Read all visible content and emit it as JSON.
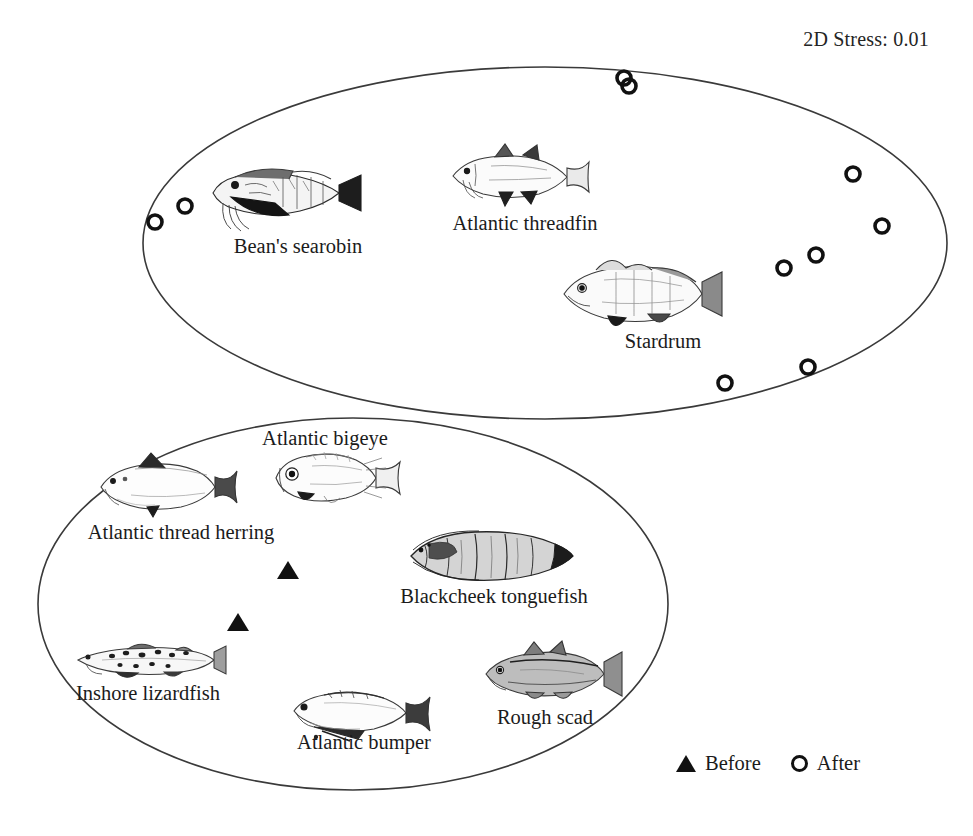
{
  "annotation": {
    "stress_label": "2D Stress: 0.01"
  },
  "legend": {
    "before_label": "Before",
    "after_label": "After",
    "before_marker": "filled-triangle",
    "after_marker": "open-circle"
  },
  "colors": {
    "ink": "#1a1a1a",
    "marker": "#111111",
    "ellipse_stroke": "#3a3a3a",
    "background": "#ffffff"
  },
  "groups": [
    {
      "id": "after-group",
      "name": "After assemblage",
      "marker": "open-circle",
      "ellipse": {
        "cx": 545,
        "cy": 243,
        "rx": 402,
        "ry": 176
      },
      "species": [
        {
          "name": "Bean's searobin",
          "label_x": 298,
          "label_y": 235,
          "art_x": 205,
          "art_y": 163,
          "art_w": 160,
          "art_h": 72,
          "art": "searobin"
        },
        {
          "name": "Atlantic threadfin",
          "label_x": 525,
          "label_y": 212,
          "art_x": 447,
          "art_y": 146,
          "art_w": 145,
          "art_h": 62,
          "art": "threadfin"
        },
        {
          "name": "Stardrum",
          "label_x": 663,
          "label_y": 330,
          "art_x": 556,
          "art_y": 256,
          "art_w": 170,
          "art_h": 78,
          "art": "stardrum"
        }
      ],
      "points": [
        {
          "x": 155,
          "y": 222
        },
        {
          "x": 185,
          "y": 206
        },
        {
          "x": 624,
          "y": 78
        },
        {
          "x": 629,
          "y": 86
        },
        {
          "x": 853,
          "y": 174
        },
        {
          "x": 882,
          "y": 226
        },
        {
          "x": 816,
          "y": 255
        },
        {
          "x": 784,
          "y": 268
        },
        {
          "x": 808,
          "y": 367
        },
        {
          "x": 725,
          "y": 383
        }
      ]
    },
    {
      "id": "before-group",
      "name": "Before assemblage",
      "marker": "filled-triangle",
      "ellipse": {
        "cx": 353,
        "cy": 604,
        "rx": 315,
        "ry": 186
      },
      "species": [
        {
          "name": "Atlantic bigeye",
          "label_x": 325,
          "label_y": 427,
          "art_x": 268,
          "art_y": 448,
          "art_w": 135,
          "art_h": 62,
          "art": "bigeye"
        },
        {
          "name": "Atlantic thread herring",
          "label_x": 181,
          "label_y": 521,
          "art_x": 95,
          "art_y": 455,
          "art_w": 145,
          "art_h": 62,
          "art": "herring"
        },
        {
          "name": "Blackcheek tonguefish",
          "label_x": 494,
          "label_y": 585,
          "art_x": 405,
          "art_y": 528,
          "art_w": 170,
          "art_h": 56,
          "art": "tonguefish"
        },
        {
          "name": "Inshore lizardfish",
          "label_x": 148,
          "label_y": 682,
          "art_x": 72,
          "art_y": 640,
          "art_w": 155,
          "art_h": 42,
          "art": "lizardfish"
        },
        {
          "name": "Atlantic bumper",
          "label_x": 364,
          "label_y": 731,
          "art_x": 288,
          "art_y": 687,
          "art_w": 150,
          "art_h": 55,
          "art": "bumper"
        },
        {
          "name": "Rough scad",
          "label_x": 545,
          "label_y": 706,
          "art_x": 480,
          "art_y": 640,
          "art_w": 145,
          "art_h": 68,
          "art": "scad"
        }
      ],
      "points": [
        {
          "x": 288,
          "y": 570
        },
        {
          "x": 238,
          "y": 622
        }
      ]
    }
  ],
  "chart_data": {
    "type": "scatter",
    "title": "",
    "subtitle": "",
    "xlabel": "",
    "ylabel": "",
    "grid": false,
    "axes_visible": false,
    "legend_position": "bottom-right",
    "annotations": [
      "2D Stress: 0.01"
    ],
    "legend_entries": [
      "Before",
      "After"
    ],
    "series": [
      {
        "name": "Before",
        "marker": "filled-triangle",
        "color": "#111111",
        "points": [
          [
            288,
            570
          ],
          [
            238,
            622
          ]
        ]
      },
      {
        "name": "After",
        "marker": "open-circle",
        "color": "#111111",
        "points": [
          [
            155,
            222
          ],
          [
            185,
            206
          ],
          [
            624,
            78
          ],
          [
            629,
            86
          ],
          [
            853,
            174
          ],
          [
            882,
            226
          ],
          [
            816,
            255
          ],
          [
            784,
            268
          ],
          [
            808,
            367
          ],
          [
            725,
            383
          ]
        ]
      }
    ],
    "group_hulls": [
      {
        "name": "After",
        "shape": "ellipse",
        "cx": 545,
        "cy": 243,
        "rx": 402,
        "ry": 176
      },
      {
        "name": "Before",
        "shape": "ellipse",
        "cx": 353,
        "cy": 604,
        "rx": 315,
        "ry": 186
      }
    ]
  }
}
